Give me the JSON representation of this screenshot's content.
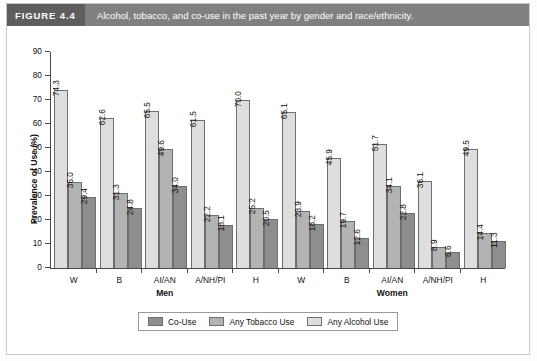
{
  "header": {
    "figure_tag": "FIGURE 4.4",
    "caption": "Alcohol, tobacco, and co-use in the past year by gender and race/ethnicity."
  },
  "chart_data": {
    "type": "bar",
    "title": "Alcohol, tobacco, and co-use in the past year by gender and race/ethnicity.",
    "xlabel": "",
    "ylabel": "Prevalence of Use (%)",
    "ylim": [
      0,
      90
    ],
    "yticks": [
      0,
      10,
      20,
      30,
      40,
      50,
      60,
      70,
      80,
      90
    ],
    "grid": false,
    "legend_position": "bottom-center",
    "panels": [
      {
        "name": "Men",
        "categories": [
          "W",
          "B",
          "AI/AN",
          "A/NH/PI",
          "H"
        ]
      },
      {
        "name": "Women",
        "categories": [
          "W",
          "B",
          "AI/AN",
          "A/NH/PI",
          "H"
        ]
      }
    ],
    "categories": [
      "W",
      "B",
      "AI/AN",
      "A/NH/PI",
      "H",
      "W",
      "B",
      "AI/AN",
      "A/NH/PI",
      "H"
    ],
    "series": [
      {
        "name": "Any Alcohol Use",
        "color": "#dedede",
        "values": [
          74.3,
          62.6,
          65.5,
          61.5,
          70.0,
          65.1,
          45.9,
          51.7,
          36.1,
          49.5
        ]
      },
      {
        "name": "Any Tobacco Use",
        "color": "#b3b3b3",
        "values": [
          36.0,
          31.3,
          49.6,
          22.2,
          25.2,
          23.9,
          19.7,
          34.1,
          8.9,
          14.4
        ]
      },
      {
        "name": "Co-Use",
        "color": "#8e8e8e",
        "values": [
          29.4,
          24.8,
          34.0,
          18.1,
          20.5,
          18.2,
          12.6,
          22.8,
          6.6,
          11.3
        ]
      }
    ],
    "groups": [
      {
        "panel": "Men",
        "category": "W",
        "alcohol": 74.3,
        "tobacco": 36.0,
        "couse": 29.4
      },
      {
        "panel": "Men",
        "category": "B",
        "alcohol": 62.6,
        "tobacco": 31.3,
        "couse": 24.8
      },
      {
        "panel": "Men",
        "category": "AI/AN",
        "alcohol": 65.5,
        "tobacco": 49.6,
        "couse": 34.0
      },
      {
        "panel": "Men",
        "category": "A/NH/PI",
        "alcohol": 61.5,
        "tobacco": 22.2,
        "couse": 18.1
      },
      {
        "panel": "Men",
        "category": "H",
        "alcohol": 70.0,
        "tobacco": 25.2,
        "couse": 20.5
      },
      {
        "panel": "Women",
        "category": "W",
        "alcohol": 65.1,
        "tobacco": 23.9,
        "couse": 18.2
      },
      {
        "panel": "Women",
        "category": "B",
        "alcohol": 45.9,
        "tobacco": 19.7,
        "couse": 12.6
      },
      {
        "panel": "Women",
        "category": "AI/AN",
        "alcohol": 51.7,
        "tobacco": 34.1,
        "couse": 22.8
      },
      {
        "panel": "Women",
        "category": "A/NH/PI",
        "alcohol": 36.1,
        "tobacco": 8.9,
        "couse": 6.6
      },
      {
        "panel": "Women",
        "category": "H",
        "alcohol": 49.5,
        "tobacco": 14.4,
        "couse": 11.3
      }
    ],
    "legend": [
      {
        "label": "Co-Use",
        "color": "#8e8e8e"
      },
      {
        "label": "Any Tobacco Use",
        "color": "#b3b3b3"
      },
      {
        "label": "Any Alcohol Use",
        "color": "#dedede"
      }
    ]
  }
}
